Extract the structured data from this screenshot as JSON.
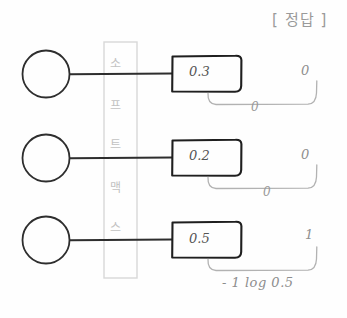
{
  "header": {
    "title": "[ 정답 ]"
  },
  "softmax_column": {
    "label": "소프트맥스",
    "chars": [
      "소",
      "프",
      "트",
      "맥",
      "스"
    ]
  },
  "rows": [
    {
      "node": "neuron-circle",
      "output_value": "0.3",
      "target_value": "0",
      "brace_label": "0"
    },
    {
      "node": "neuron-circle",
      "output_value": "0.2",
      "target_value": "0",
      "brace_label": "0"
    },
    {
      "node": "neuron-circle",
      "output_value": "0.5",
      "target_value": "1",
      "brace_label": ""
    }
  ],
  "formula": "- 1 log 0.5",
  "colors": {
    "ink_dark": "#2a2a2a",
    "ink_mid": "#555555",
    "ink_light": "#9a9a9a",
    "ink_faint": "#c8c8c8",
    "paper": "#fefefe"
  }
}
